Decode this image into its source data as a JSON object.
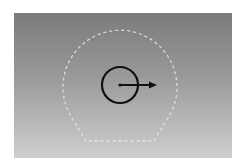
{
  "diagram": {
    "background": {
      "gradient_top": "#7b7b7b",
      "gradient_bottom": "#cfcfcf"
    },
    "boundary": {
      "shape": "dashed-circle-truncated",
      "center": [
        120,
        86
      ],
      "radius": 57,
      "flat_bottom_y": 141,
      "color": "#e6e6e6"
    },
    "agent": {
      "shape": "circle",
      "center": [
        120,
        85
      ],
      "radius": 18,
      "color": "#111111"
    },
    "heading_arrow": {
      "from": [
        120,
        85
      ],
      "to": [
        156,
        85
      ],
      "color": "#111111"
    }
  }
}
